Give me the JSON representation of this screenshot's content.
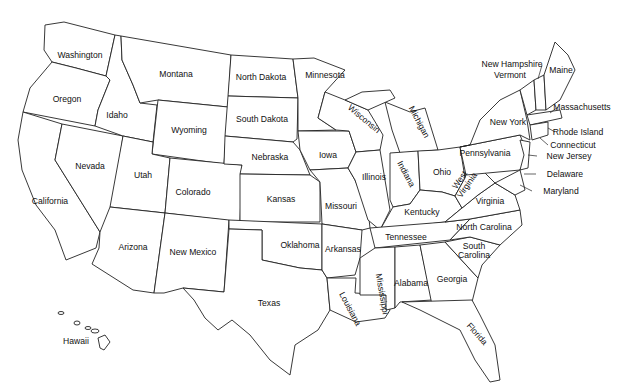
{
  "map": {
    "title": "United States",
    "states": [
      {
        "name": "Washington",
        "x": 80,
        "y": 55
      },
      {
        "name": "Oregon",
        "x": 67,
        "y": 99
      },
      {
        "name": "California",
        "x": 50,
        "y": 201
      },
      {
        "name": "Idaho",
        "x": 117,
        "y": 115
      },
      {
        "name": "Nevada",
        "x": 90,
        "y": 166
      },
      {
        "name": "Montana",
        "x": 176,
        "y": 74
      },
      {
        "name": "Wyoming",
        "x": 189,
        "y": 130
      },
      {
        "name": "Utah",
        "x": 143,
        "y": 175
      },
      {
        "name": "Arizona",
        "x": 133,
        "y": 247
      },
      {
        "name": "Colorado",
        "x": 193,
        "y": 192
      },
      {
        "name": "New Mexico",
        "x": 193,
        "y": 252
      },
      {
        "name": "North Dakota",
        "x": 261,
        "y": 77
      },
      {
        "name": "South Dakota",
        "x": 262,
        "y": 119
      },
      {
        "name": "Nebraska",
        "x": 270,
        "y": 157
      },
      {
        "name": "Kansas",
        "x": 281,
        "y": 199
      },
      {
        "name": "Oklahoma",
        "x": 300,
        "y": 245
      },
      {
        "name": "Texas",
        "x": 269,
        "y": 303
      },
      {
        "name": "Minnesota",
        "x": 325,
        "y": 75
      },
      {
        "name": "Iowa",
        "x": 328,
        "y": 155
      },
      {
        "name": "Missouri",
        "x": 341,
        "y": 206
      },
      {
        "name": "Arkansas",
        "x": 343,
        "y": 249
      },
      {
        "name": "Louisiana",
        "x": 350,
        "y": 309,
        "rotate": 62
      },
      {
        "name": "Wisconsin",
        "x": 364,
        "y": 119,
        "rotate": 40
      },
      {
        "name": "Illinois",
        "x": 374,
        "y": 177
      },
      {
        "name": "Michigan",
        "x": 419,
        "y": 122,
        "rotate": 62
      },
      {
        "name": "Indiana",
        "x": 406,
        "y": 174,
        "rotate": 62
      },
      {
        "name": "Ohio",
        "x": 442,
        "y": 172
      },
      {
        "name": "Kentucky",
        "x": 422,
        "y": 212
      },
      {
        "name": "Tennessee",
        "x": 406,
        "y": 237
      },
      {
        "name": "Mississippi",
        "x": 382,
        "y": 294,
        "rotate": 80
      },
      {
        "name": "Alabama",
        "x": 411,
        "y": 283
      },
      {
        "name": "Georgia",
        "x": 452,
        "y": 279
      },
      {
        "name": "Florida",
        "x": 477,
        "y": 334,
        "rotate": 48
      },
      {
        "name": "South Carolina",
        "x": 474,
        "y": 251,
        "multiline": [
          "South",
          "Carolina"
        ]
      },
      {
        "name": "North Carolina",
        "x": 484,
        "y": 227
      },
      {
        "name": "Virginia",
        "x": 490,
        "y": 201
      },
      {
        "name": "West Virginia",
        "x": 464,
        "y": 183,
        "multiline": [
          "West",
          "Virginia"
        ],
        "rotate": -55
      },
      {
        "name": "Pennsylvania",
        "x": 485,
        "y": 153
      },
      {
        "name": "New York",
        "x": 508,
        "y": 122
      },
      {
        "name": "Maine",
        "x": 561,
        "y": 70
      },
      {
        "name": "Vermont",
        "x": 510,
        "y": 75
      },
      {
        "name": "New Hampshire",
        "x": 512,
        "y": 64
      },
      {
        "name": "Massachusetts",
        "x": 582,
        "y": 107
      },
      {
        "name": "Rhode Island",
        "x": 578,
        "y": 132
      },
      {
        "name": "Connecticut",
        "x": 573,
        "y": 145
      },
      {
        "name": "New Jersey",
        "x": 569,
        "y": 156
      },
      {
        "name": "Delaware",
        "x": 565,
        "y": 174
      },
      {
        "name": "Maryland",
        "x": 561,
        "y": 191
      },
      {
        "name": "Hawaii",
        "x": 76,
        "y": 341
      }
    ]
  }
}
